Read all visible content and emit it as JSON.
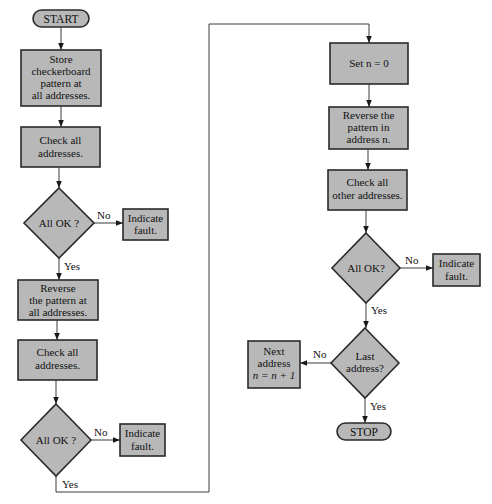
{
  "diagram": {
    "type": "flowchart",
    "colors": {
      "node_fill": "#b8b8b8",
      "stroke": "#2a2a2a",
      "background": "#ffffff"
    },
    "nodes": {
      "start": {
        "label": "START"
      },
      "store": {
        "lines": [
          "Store",
          "checkerboard",
          "pattern at",
          "all addresses."
        ]
      },
      "check1": {
        "lines": [
          "Check all",
          "addresses."
        ]
      },
      "decision1": {
        "label": "All OK ?"
      },
      "fault1": {
        "lines": [
          "Indicate",
          "fault."
        ]
      },
      "reverse_all": {
        "lines": [
          "Reverse",
          "the pattern at",
          "all addresses."
        ]
      },
      "check2": {
        "lines": [
          "Check all",
          "addresses."
        ]
      },
      "decision2": {
        "label": "All OK ?"
      },
      "fault2": {
        "lines": [
          "Indicate",
          "fault."
        ]
      },
      "set_n": {
        "label": "Set n = 0"
      },
      "reverse_n": {
        "lines": [
          "Reverse the",
          "pattern in",
          "address n."
        ]
      },
      "check_other": {
        "lines": [
          "Check all",
          "other addresses."
        ]
      },
      "decision3": {
        "label": "All OK?"
      },
      "fault3": {
        "lines": [
          "Indicate",
          "fault."
        ]
      },
      "last": {
        "lines": [
          "Last",
          "address?"
        ]
      },
      "next": {
        "lines": [
          "Next",
          "address",
          "n = n + 1"
        ]
      },
      "stop": {
        "label": "STOP"
      }
    },
    "edge_labels": {
      "d1_no": "No",
      "d1_yes": "Yes",
      "d2_no": "No",
      "d2_yes": "Yes",
      "d3_no": "No",
      "d3_yes": "Yes",
      "last_no": "No",
      "last_yes": "Yes"
    }
  }
}
